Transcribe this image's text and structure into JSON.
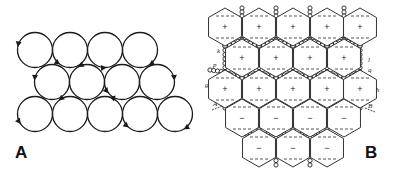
{
  "panels": [
    {
      "id": "A",
      "label": "A",
      "description": "Close-packed circles with rotation arrows",
      "circle_radius": 17.5,
      "circles": [
        {
          "cx": 35,
          "cy": 50,
          "arrow_angle": 170,
          "arrow_dir": "ccw"
        },
        {
          "cx": 70,
          "cy": 50,
          "arrow_angle": 235,
          "arrow_dir": "ccw"
        },
        {
          "cx": 105,
          "cy": 50,
          "arrow_angle": 275,
          "arrow_dir": "ccw"
        },
        {
          "cx": 140,
          "cy": 50,
          "arrow_angle": 300,
          "arrow_dir": "cw"
        },
        {
          "cx": 52,
          "cy": 82,
          "arrow_angle": 175,
          "arrow_dir": "ccw"
        },
        {
          "cx": 87,
          "cy": 82,
          "arrow_angle": 120,
          "arrow_dir": "ccw"
        },
        {
          "cx": 122,
          "cy": 82,
          "arrow_angle": 220,
          "arrow_dir": "ccw"
        },
        {
          "cx": 157,
          "cy": 82,
          "arrow_angle": 5,
          "arrow_dir": "cw"
        },
        {
          "cx": 35,
          "cy": 114,
          "arrow_angle": 215,
          "arrow_dir": "ccw"
        },
        {
          "cx": 70,
          "cy": 114,
          "arrow_angle": 130,
          "arrow_dir": "ccw"
        },
        {
          "cx": 105,
          "cy": 114,
          "arrow_angle": 75,
          "arrow_dir": "ccw"
        },
        {
          "cx": 140,
          "cy": 114,
          "arrow_angle": 230,
          "arrow_dir": "ccw"
        },
        {
          "cx": 175,
          "cy": 114,
          "arrow_angle": 300,
          "arrow_dir": "cw"
        }
      ]
    },
    {
      "id": "B",
      "label": "B",
      "description": "Hexagonal cells with charge signs separated by chains of small beads",
      "hex_radius": 19,
      "hexagons": [
        {
          "cx": 225,
          "cy": 27,
          "sign": "+"
        },
        {
          "cx": 259,
          "cy": 27,
          "sign": "+"
        },
        {
          "cx": 293,
          "cy": 27,
          "sign": "+"
        },
        {
          "cx": 327,
          "cy": 27,
          "sign": "+"
        },
        {
          "cx": 360,
          "cy": 27,
          "sign": "+"
        },
        {
          "cx": 242,
          "cy": 58,
          "sign": "+"
        },
        {
          "cx": 276,
          "cy": 58,
          "sign": "+"
        },
        {
          "cx": 310,
          "cy": 58,
          "sign": "+"
        },
        {
          "cx": 344,
          "cy": 58,
          "sign": "+"
        },
        {
          "cx": 225,
          "cy": 89,
          "sign": "+"
        },
        {
          "cx": 259,
          "cy": 89,
          "sign": "+"
        },
        {
          "cx": 293,
          "cy": 89,
          "sign": "+"
        },
        {
          "cx": 327,
          "cy": 89,
          "sign": "+"
        },
        {
          "cx": 360,
          "cy": 89,
          "sign": "+"
        },
        {
          "cx": 242,
          "cy": 118,
          "sign": "−"
        },
        {
          "cx": 276,
          "cy": 118,
          "sign": "−"
        },
        {
          "cx": 310,
          "cy": 118,
          "sign": "−"
        },
        {
          "cx": 344,
          "cy": 118,
          "sign": "−"
        },
        {
          "cx": 259,
          "cy": 148,
          "sign": "−"
        },
        {
          "cx": 293,
          "cy": 148,
          "sign": "−"
        },
        {
          "cx": 327,
          "cy": 148,
          "sign": "−"
        }
      ],
      "annotations": [
        {
          "text": "k",
          "x": 217,
          "y": 53
        },
        {
          "text": "p",
          "x": 213,
          "y": 67
        },
        {
          "text": "g",
          "x": 205,
          "y": 87
        },
        {
          "text": "A",
          "x": 213,
          "y": 106
        },
        {
          "text": "l",
          "x": 368,
          "y": 62
        },
        {
          "text": "q",
          "x": 368,
          "y": 72
        },
        {
          "text": "h",
          "x": 376,
          "y": 92
        },
        {
          "text": "B",
          "x": 368,
          "y": 108
        }
      ]
    }
  ],
  "colors": {
    "stroke": "#1a1a1a",
    "hex_stroke": "#333333",
    "background": "#ffffff"
  }
}
